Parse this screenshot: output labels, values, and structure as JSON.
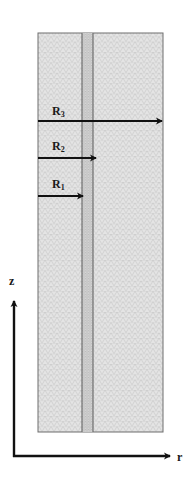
{
  "diagram": {
    "type": "axisymmetric-mesh-geometry",
    "colors": {
      "background": "#ffffff",
      "mesh_fill": "#e3e3e3",
      "mesh_line": "#b8b8b8",
      "boundary": "#6e6e6e",
      "arrow": "#111111",
      "text": "#1a1a1a"
    },
    "domain": {
      "x": 38,
      "y": 33,
      "width": 125,
      "height": 399
    },
    "inner_strip": {
      "x_left": 82,
      "x_right": 93
    },
    "radius_arrows": [
      {
        "label": "R3",
        "label_main": "R",
        "label_sub": "3",
        "y": 121,
        "x_start": 38,
        "x_end": 163
      },
      {
        "label": "R2",
        "label_main": "R",
        "label_sub": "2",
        "y": 158,
        "x_start": 38,
        "x_end": 97
      },
      {
        "label": "R1",
        "label_main": "R",
        "label_sub": "1",
        "y": 196,
        "x_start": 38,
        "x_end": 84
      }
    ],
    "axes": {
      "origin": {
        "x": 14,
        "y": 456
      },
      "z_axis": {
        "label": "z",
        "y_end": 300
      },
      "r_axis": {
        "label": "r",
        "x_end": 171
      }
    }
  }
}
